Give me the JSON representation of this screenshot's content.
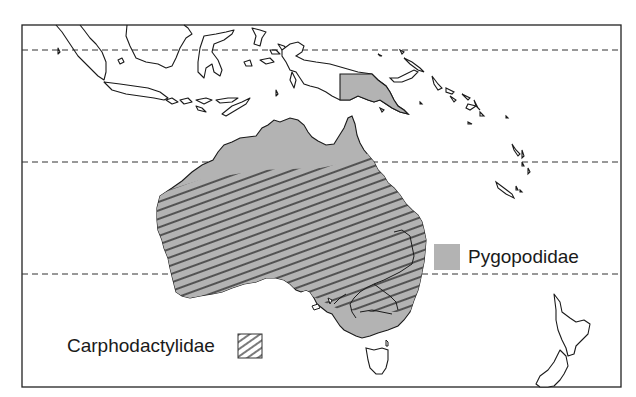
{
  "map": {
    "title": "Distribution of Pygopodidae and Carphodactylidae in Australasia",
    "region": "Australia, New Guinea, Indonesia, Melanesia, New Zealand",
    "frame": {
      "left": 22,
      "top": 25,
      "right": 621,
      "bottom": 387
    },
    "latitude_lines_y": [
      50,
      162,
      274
    ],
    "colors": {
      "pygopodidae_fill": "#b3b3b3",
      "carphodactylidae_hatch": "#3a3a3a",
      "coastline": "#1a1a1a",
      "background": "#ffffff"
    }
  },
  "legend": {
    "items": [
      {
        "label": "Pygopodidae",
        "pattern": "solid-gray"
      },
      {
        "label": "Carphodactylidae",
        "pattern": "diagonal-hatch"
      }
    ]
  }
}
